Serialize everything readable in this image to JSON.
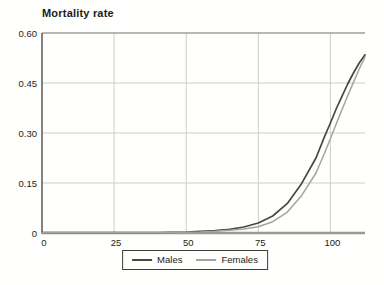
{
  "chart_data": {
    "type": "line",
    "title": "Mortality rate",
    "xlabel": "",
    "ylabel": "Mortality rate",
    "xlim": [
      0,
      112
    ],
    "ylim": [
      0,
      0.6
    ],
    "grid": true,
    "legend_position": "bottom-center",
    "x_ticks": [
      {
        "value": 0,
        "label": "0"
      },
      {
        "value": 25,
        "label": "25"
      },
      {
        "value": 50,
        "label": "50"
      },
      {
        "value": 75,
        "label": "75"
      },
      {
        "value": 100,
        "label": "100"
      }
    ],
    "y_ticks": [
      {
        "value": 0,
        "label": "0"
      },
      {
        "value": 0.15,
        "label": "0.15"
      },
      {
        "value": 0.3,
        "label": "0.30"
      },
      {
        "value": 0.45,
        "label": "0.45"
      },
      {
        "value": 0.6,
        "label": "0.60"
      }
    ],
    "series": [
      {
        "name": "Males",
        "color": "#474745",
        "points": [
          [
            0,
            0.001
          ],
          [
            10,
            0.001
          ],
          [
            20,
            0.001
          ],
          [
            30,
            0.001
          ],
          [
            40,
            0.001
          ],
          [
            45,
            0.002
          ],
          [
            50,
            0.003
          ],
          [
            55,
            0.005
          ],
          [
            60,
            0.007
          ],
          [
            65,
            0.011
          ],
          [
            70,
            0.018
          ],
          [
            75,
            0.03
          ],
          [
            80,
            0.051
          ],
          [
            85,
            0.088
          ],
          [
            90,
            0.148
          ],
          [
            95,
            0.225
          ],
          [
            98,
            0.29
          ],
          [
            100,
            0.33
          ],
          [
            102,
            0.372
          ],
          [
            104,
            0.41
          ],
          [
            106,
            0.447
          ],
          [
            108,
            0.48
          ],
          [
            110,
            0.51
          ],
          [
            112,
            0.535
          ]
        ]
      },
      {
        "name": "Females",
        "color": "#a3a3a1",
        "points": [
          [
            0,
            0.001
          ],
          [
            10,
            0.001
          ],
          [
            20,
            0.001
          ],
          [
            30,
            0.001
          ],
          [
            40,
            0.001
          ],
          [
            45,
            0.001
          ],
          [
            50,
            0.002
          ],
          [
            55,
            0.003
          ],
          [
            60,
            0.005
          ],
          [
            65,
            0.008
          ],
          [
            70,
            0.012
          ],
          [
            75,
            0.019
          ],
          [
            80,
            0.034
          ],
          [
            85,
            0.062
          ],
          [
            90,
            0.112
          ],
          [
            95,
            0.18
          ],
          [
            98,
            0.24
          ],
          [
            100,
            0.283
          ],
          [
            102,
            0.327
          ],
          [
            104,
            0.37
          ],
          [
            106,
            0.412
          ],
          [
            108,
            0.452
          ],
          [
            110,
            0.492
          ],
          [
            112,
            0.528
          ]
        ]
      }
    ],
    "styles": {
      "gridline_color": "#cdcdcb",
      "top_border_color": "#6e6e6c",
      "left_axis_color": "#2e2e2c",
      "bottom_axis_color": "#999997",
      "tick_label_color": "#1b1b19"
    }
  },
  "legend": {
    "items": [
      {
        "label": "Males"
      },
      {
        "label": "Females"
      }
    ]
  }
}
